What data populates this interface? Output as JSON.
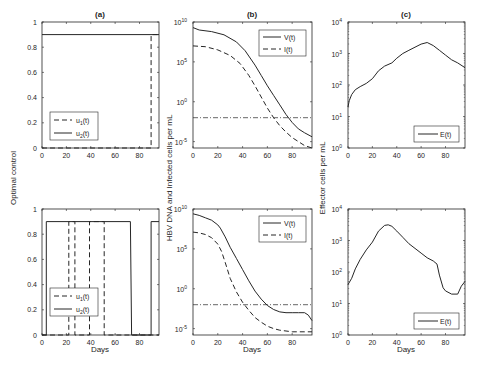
{
  "chart_data": [
    {
      "id": "a-top",
      "panel": "(a)",
      "type": "line",
      "title": "(a)",
      "xlabel": "",
      "ylabel": "Optimal control",
      "xlim": [
        0,
        96
      ],
      "ylim": [
        0,
        1
      ],
      "yscale": "linear",
      "xticks": [
        0,
        20,
        40,
        60,
        80
      ],
      "yticks": [
        0,
        0.2,
        0.4,
        0.6,
        0.8,
        1
      ],
      "ytick_labels": [
        "0",
        "0.2",
        "0.4",
        "0.6",
        "0.8",
        "1"
      ],
      "legend": {
        "position": "lower-left",
        "entries": [
          "u1(t)",
          "u2(t)"
        ]
      },
      "series": [
        {
          "name": "u1(t)",
          "style": "dashed",
          "x": [
            0,
            89.5,
            89.5,
            96
          ],
          "y": [
            0,
            0,
            0.9,
            0.9
          ]
        },
        {
          "name": "u2(t)",
          "style": "solid",
          "x": [
            0,
            96
          ],
          "y": [
            0.9,
            0.9
          ]
        }
      ]
    },
    {
      "id": "a-bottom",
      "panel": "(a)",
      "type": "line",
      "title": "",
      "xlabel": "Days",
      "ylabel": "Optimal control",
      "xlim": [
        0,
        96
      ],
      "ylim": [
        0,
        1
      ],
      "yscale": "linear",
      "xticks": [
        0,
        20,
        40,
        60,
        80
      ],
      "yticks": [
        0,
        0.2,
        0.4,
        0.6,
        0.8,
        1
      ],
      "ytick_labels": [
        "0",
        "0.2",
        "0.4",
        "0.6",
        "0.8",
        "1"
      ],
      "legend": {
        "position": "lower-left",
        "entries": [
          "u1(t)",
          "u2(t)"
        ]
      },
      "series": [
        {
          "name": "u1(t)",
          "style": "dashed",
          "x": [
            0,
            22,
            22,
            27,
            27,
            39,
            39,
            51,
            51,
            96
          ],
          "y": [
            0,
            0,
            0.9,
            0.9,
            0,
            0,
            0.9,
            0.9,
            0,
            0
          ]
        },
        {
          "name": "u2(t)",
          "style": "solid",
          "x": [
            0,
            3.5,
            3.5,
            72.5,
            73.5,
            89.5,
            89.5,
            96
          ],
          "y": [
            0,
            0,
            0.9,
            0.9,
            0,
            0,
            0.9,
            0.9
          ]
        }
      ]
    },
    {
      "id": "b-top",
      "panel": "(b)",
      "type": "line",
      "title": "(b)",
      "xlabel": "",
      "ylabel": "HBV DNA and Infected cells per mL",
      "xlim": [
        0,
        96
      ],
      "ylim_log10": [
        -5.8,
        10
      ],
      "yscale": "log",
      "xticks": [
        0,
        20,
        40,
        60,
        80
      ],
      "yticks_log10": [
        -5,
        0,
        5,
        10
      ],
      "ytick_labels": [
        "10^-5",
        "10^0",
        "10^5",
        "10^10"
      ],
      "legend": {
        "position": "upper-right",
        "entries": [
          "V(t)",
          "I(t)"
        ]
      },
      "threshold_log10": -2,
      "series": [
        {
          "name": "V(t)",
          "style": "solid",
          "x": [
            0,
            5,
            15,
            25,
            35,
            42,
            50,
            55,
            60,
            65,
            70,
            75,
            80,
            85,
            90,
            96
          ],
          "log10_y": [
            9.3,
            9.0,
            8.8,
            8.4,
            7.5,
            6.4,
            4.6,
            3.3,
            2.0,
            0.8,
            -0.4,
            -1.6,
            -2.6,
            -3.4,
            -3.9,
            -4.4
          ]
        },
        {
          "name": "I(t)",
          "style": "dashed",
          "x": [
            0,
            10,
            20,
            30,
            38,
            45,
            50,
            55,
            60,
            65,
            70,
            75,
            80,
            85,
            90,
            96
          ],
          "log10_y": [
            7.0,
            6.9,
            6.5,
            5.8,
            4.8,
            3.3,
            2.0,
            0.6,
            -0.8,
            -2.0,
            -3.0,
            -3.8,
            -4.5,
            -5.0,
            -5.5,
            -5.8
          ]
        }
      ]
    },
    {
      "id": "b-bottom",
      "panel": "(b)",
      "type": "line",
      "title": "",
      "xlabel": "Days",
      "ylabel": "HBV DNA and Infected cells per mL",
      "xlim": [
        0,
        96
      ],
      "ylim_log10": [
        -5.8,
        10
      ],
      "yscale": "log",
      "xticks": [
        0,
        20,
        40,
        60,
        80
      ],
      "yticks_log10": [
        -5,
        0,
        5,
        10
      ],
      "ytick_labels": [
        "10^-5",
        "10^0",
        "10^5",
        "10^10"
      ],
      "legend": {
        "position": "upper-right",
        "entries": [
          "V(t)",
          "I(t)"
        ]
      },
      "threshold_log10": -2,
      "series": [
        {
          "name": "V(t)",
          "style": "solid",
          "x": [
            0,
            5,
            10,
            15,
            20,
            22,
            26,
            30,
            35,
            40,
            45,
            50,
            55,
            60,
            65,
            70,
            75,
            80,
            85,
            90,
            93,
            96
          ],
          "log10_y": [
            9.4,
            9.2,
            8.9,
            8.6,
            8.0,
            7.6,
            6.5,
            5.2,
            3.8,
            2.4,
            1.0,
            -0.3,
            -1.3,
            -2.1,
            -2.6,
            -2.9,
            -3.0,
            -3.0,
            -3.0,
            -3.0,
            -3.3,
            -4.0
          ]
        },
        {
          "name": "I(t)",
          "style": "dashed",
          "x": [
            0,
            5,
            10,
            15,
            20,
            23,
            26,
            30,
            35,
            40,
            45,
            50,
            55,
            60,
            65,
            70,
            75,
            80,
            85,
            90,
            96
          ],
          "log10_y": [
            7.1,
            7.0,
            6.8,
            6.4,
            5.6,
            4.7,
            3.3,
            1.3,
            -0.4,
            -1.7,
            -2.7,
            -3.6,
            -4.2,
            -4.7,
            -5.0,
            -5.2,
            -5.3,
            -5.4,
            -5.4,
            -5.4,
            -5.4
          ]
        }
      ]
    },
    {
      "id": "c-top",
      "panel": "(c)",
      "type": "line",
      "title": "(c)",
      "xlabel": "",
      "ylabel": "Effector cells per mL",
      "xlim": [
        0,
        96
      ],
      "ylim_log10": [
        0,
        4
      ],
      "yscale": "log",
      "xticks": [
        0,
        20,
        40,
        60,
        80
      ],
      "yticks_log10": [
        0,
        1,
        2,
        3,
        4
      ],
      "ytick_labels": [
        "10^0",
        "10^1",
        "10^2",
        "10^3",
        "10^4"
      ],
      "legend": {
        "position": "lower-right",
        "entries": [
          "E(t)"
        ]
      },
      "series": [
        {
          "name": "E(t)",
          "style": "solid",
          "x": [
            0,
            1,
            3,
            6,
            10,
            15,
            20,
            25,
            30,
            36,
            40,
            45,
            50,
            55,
            60,
            65,
            70,
            75,
            80,
            85,
            90,
            96
          ],
          "log10_y": [
            1.3,
            1.5,
            1.7,
            1.85,
            1.95,
            2.05,
            2.2,
            2.45,
            2.6,
            2.7,
            2.85,
            3.0,
            3.1,
            3.2,
            3.3,
            3.35,
            3.25,
            3.1,
            2.95,
            2.8,
            2.7,
            2.55
          ]
        }
      ]
    },
    {
      "id": "c-bottom",
      "panel": "(c)",
      "type": "line",
      "title": "",
      "xlabel": "Days",
      "ylabel": "Effector cells per mL",
      "xlim": [
        0,
        96
      ],
      "ylim_log10": [
        0,
        4
      ],
      "yscale": "log",
      "xticks": [
        0,
        20,
        40,
        60,
        80
      ],
      "yticks_log10": [
        0,
        1,
        2,
        3,
        4
      ],
      "ytick_labels": [
        "10^0",
        "10^1",
        "10^2",
        "10^3",
        "10^4"
      ],
      "legend": {
        "position": "lower-right",
        "entries": [
          "E(t)"
        ]
      },
      "series": [
        {
          "name": "E(t)",
          "style": "solid",
          "x": [
            0,
            3,
            6,
            10,
            15,
            20,
            25,
            30,
            33,
            36,
            40,
            45,
            50,
            55,
            60,
            65,
            70,
            73,
            75,
            78,
            80,
            85,
            90,
            93,
            96
          ],
          "log10_y": [
            1.6,
            1.8,
            2.1,
            2.4,
            2.7,
            2.95,
            3.3,
            3.48,
            3.5,
            3.45,
            3.3,
            3.1,
            2.9,
            2.75,
            2.6,
            2.45,
            2.35,
            2.25,
            1.9,
            1.5,
            1.4,
            1.3,
            1.3,
            1.55,
            1.7
          ]
        }
      ]
    }
  ],
  "labels": {
    "panel_a": "(a)",
    "panel_b": "(b)",
    "panel_c": "(c)",
    "ylabel_a": "Optimal control",
    "ylabel_b": "HBV DNA and Infected cells per mL",
    "ylabel_c": "Effector cells per mL",
    "xlabel": "Days",
    "legend_u1": "u",
    "legend_u1_sub": "1",
    "legend_u2": "u",
    "legend_u2_sub": "2",
    "legend_t": "(t)",
    "legend_V": "V(t)",
    "legend_I": "I(t)",
    "legend_E": "E(t)"
  },
  "colors": {
    "line": "#262626",
    "axis": "#262626",
    "threshold": "#262626"
  }
}
